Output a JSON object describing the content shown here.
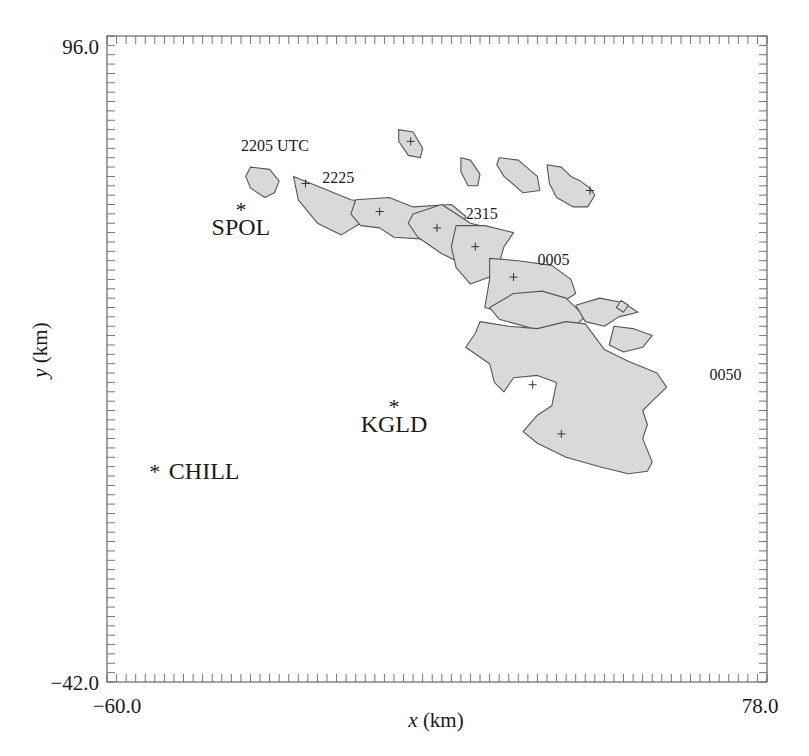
{
  "chart_data": {
    "type": "map-overlay",
    "title": "",
    "xlabel": "x (km)",
    "ylabel": "y (km)",
    "xlim": [
      -60.0,
      78.0
    ],
    "ylim": [
      -42.0,
      96.0
    ],
    "x_tick_labels": [
      "-60.0",
      "78.0"
    ],
    "y_tick_labels": [
      "96.0",
      "-42.0"
    ],
    "minor_tick_spacing_km": 2,
    "grid": false,
    "legend": null,
    "radars": [
      {
        "name": "SPOL",
        "x": -32.0,
        "y": 59.0
      },
      {
        "name": "KGLD",
        "x": 0.0,
        "y": 17.0
      },
      {
        "name": "CHILL",
        "x": -50.0,
        "y": 3.0
      }
    ],
    "time_labels": [
      {
        "text": "2205 UTC",
        "x": -32.0,
        "y": 71.5
      },
      {
        "text": "2225",
        "x": -15.0,
        "y": 64.5
      },
      {
        "text": "2315",
        "x": 15.0,
        "y": 57.0
      },
      {
        "text": "0005",
        "x": 30.0,
        "y": 47.0
      },
      {
        "text": "0050",
        "x": 66.0,
        "y": 22.5
      }
    ],
    "storm_cells": [
      {
        "id": "cell-2205",
        "time": "2205 UTC",
        "centroid": null,
        "outline": [
          [
            -30,
            68
          ],
          [
            -26,
            67.5
          ],
          [
            -24,
            65
          ],
          [
            -25,
            62.5
          ],
          [
            -27,
            61.5
          ],
          [
            -30,
            63.5
          ],
          [
            -31,
            66
          ]
        ]
      },
      {
        "id": "cell-north-1",
        "time": null,
        "centroid": [
          3.5,
          73.5
        ],
        "outline": [
          [
            1,
            76
          ],
          [
            4,
            75.5
          ],
          [
            6,
            72
          ],
          [
            5.5,
            70
          ],
          [
            3,
            70.5
          ],
          [
            1,
            73.5
          ]
        ]
      },
      {
        "id": "cell-2225",
        "time": "2225",
        "centroid": [
          -18.5,
          64.5
        ],
        "outline": [
          [
            -21,
            66
          ],
          [
            -15,
            63.5
          ],
          [
            -9,
            61
          ],
          [
            -2,
            60
          ],
          [
            3,
            59.5
          ],
          [
            3,
            56
          ],
          [
            -7,
            56
          ],
          [
            -11,
            53.5
          ],
          [
            -16,
            56
          ],
          [
            -20,
            61
          ]
        ]
      },
      {
        "id": "cell-2245",
        "time": null,
        "centroid": [
          -3,
          58.5
        ],
        "outline": [
          [
            -8,
            61
          ],
          [
            -1,
            61.5
          ],
          [
            4,
            59.5
          ],
          [
            12,
            60
          ],
          [
            15,
            57.5
          ],
          [
            14,
            54.5
          ],
          [
            8,
            52.5
          ],
          [
            0,
            53
          ],
          [
            -3,
            55
          ],
          [
            -7,
            55.5
          ],
          [
            -9,
            58
          ]
        ]
      },
      {
        "id": "cell-2305",
        "time": null,
        "centroid": [
          9,
          55
        ],
        "outline": [
          [
            4,
            58
          ],
          [
            10,
            60
          ],
          [
            16,
            56
          ],
          [
            20,
            55
          ],
          [
            22,
            52
          ],
          [
            18,
            48.5
          ],
          [
            14,
            47.5
          ],
          [
            10,
            49.5
          ],
          [
            5,
            53
          ],
          [
            3,
            56
          ]
        ]
      },
      {
        "id": "cell-2315",
        "time": "2315",
        "centroid": [
          17,
          51
        ],
        "outline": [
          [
            13,
            55.5
          ],
          [
            19,
            55.5
          ],
          [
            25,
            54
          ],
          [
            23,
            51
          ],
          [
            22,
            47.5
          ],
          [
            20,
            44.5
          ],
          [
            16,
            43
          ],
          [
            13,
            46.5
          ],
          [
            12,
            51
          ]
        ]
      },
      {
        "id": "cell-2335",
        "time": null,
        "centroid": [
          25,
          44.5
        ],
        "outline": [
          [
            20,
            48.5
          ],
          [
            26,
            48
          ],
          [
            33,
            47
          ],
          [
            37,
            44
          ],
          [
            38,
            41
          ],
          [
            35,
            39
          ],
          [
            30,
            38
          ],
          [
            24,
            36.5
          ],
          [
            19,
            38
          ],
          [
            20,
            44
          ]
        ]
      },
      {
        "id": "cell-2355",
        "time": null,
        "centroid": null,
        "outline": [
          [
            20,
            38
          ],
          [
            25,
            41
          ],
          [
            31,
            41.5
          ],
          [
            36,
            40
          ],
          [
            40,
            36
          ],
          [
            37,
            33.5
          ],
          [
            33,
            32
          ],
          [
            29,
            33.5
          ],
          [
            22,
            35.5
          ]
        ]
      },
      {
        "id": "cell-0005-east",
        "time": null,
        "centroid": null,
        "outline": [
          [
            38,
            38.5
          ],
          [
            43,
            40
          ],
          [
            48,
            39
          ],
          [
            51,
            37
          ],
          [
            47,
            36
          ],
          [
            44,
            34
          ],
          [
            40,
            35
          ]
        ]
      },
      {
        "id": "cell-0005-east2",
        "time": null,
        "centroid": null,
        "outline": [
          [
            46,
            34
          ],
          [
            50,
            33.5
          ],
          [
            54,
            32
          ],
          [
            52,
            29.5
          ],
          [
            48,
            28.5
          ],
          [
            45,
            30
          ]
        ]
      },
      {
        "id": "cell-0050",
        "time": "0050",
        "centroid": [
          35,
          11
        ],
        "outline": [
          [
            18,
            35
          ],
          [
            24,
            34
          ],
          [
            30,
            33.5
          ],
          [
            36,
            35
          ],
          [
            40,
            34.5
          ],
          [
            44,
            29
          ],
          [
            49,
            26.5
          ],
          [
            55,
            24
          ],
          [
            57,
            21
          ],
          [
            54,
            18
          ],
          [
            52,
            16
          ],
          [
            53,
            13
          ],
          [
            52,
            10
          ],
          [
            54,
            5
          ],
          [
            53,
            3
          ],
          [
            49,
            2.5
          ],
          [
            43,
            4
          ],
          [
            36,
            6
          ],
          [
            30,
            9
          ],
          [
            27,
            11.5
          ],
          [
            30,
            15
          ],
          [
            33,
            17
          ],
          [
            34,
            22
          ],
          [
            30,
            23.5
          ],
          [
            25,
            23
          ],
          [
            23,
            20
          ],
          [
            21,
            22
          ],
          [
            20,
            26
          ],
          [
            15,
            29.5
          ],
          [
            17,
            32.5
          ]
        ]
      },
      {
        "id": "cell-0050-centroid2",
        "time": null,
        "centroid": [
          29,
          21.5
        ],
        "outline": []
      },
      {
        "id": "cell-north-2",
        "time": null,
        "centroid": null,
        "outline": [
          [
            14,
            70
          ],
          [
            16,
            69.5
          ],
          [
            18,
            66.5
          ],
          [
            17.5,
            64
          ],
          [
            15.5,
            64
          ],
          [
            14,
            67
          ]
        ]
      },
      {
        "id": "cell-north-3",
        "time": null,
        "centroid": null,
        "outline": [
          [
            22,
            70
          ],
          [
            26,
            69.5
          ],
          [
            30,
            66
          ],
          [
            30.5,
            63
          ],
          [
            27,
            62.5
          ],
          [
            23,
            66
          ],
          [
            21.5,
            68.5
          ]
        ]
      },
      {
        "id": "cell-north-4",
        "time": null,
        "centroid": [
          41,
          63
        ],
        "outline": [
          [
            32,
            68.5
          ],
          [
            35,
            68
          ],
          [
            37,
            66
          ],
          [
            39,
            65
          ],
          [
            41,
            63.5
          ],
          [
            42,
            62
          ],
          [
            40.5,
            59.5
          ],
          [
            37.5,
            59.5
          ],
          [
            34,
            61.5
          ],
          [
            32.5,
            64.5
          ]
        ]
      },
      {
        "id": "cell-small-diamond",
        "time": null,
        "centroid": null,
        "outline": [
          [
            47.5,
            39.5
          ],
          [
            49,
            38.5
          ],
          [
            48,
            37
          ],
          [
            46.5,
            38
          ]
        ]
      }
    ]
  }
}
